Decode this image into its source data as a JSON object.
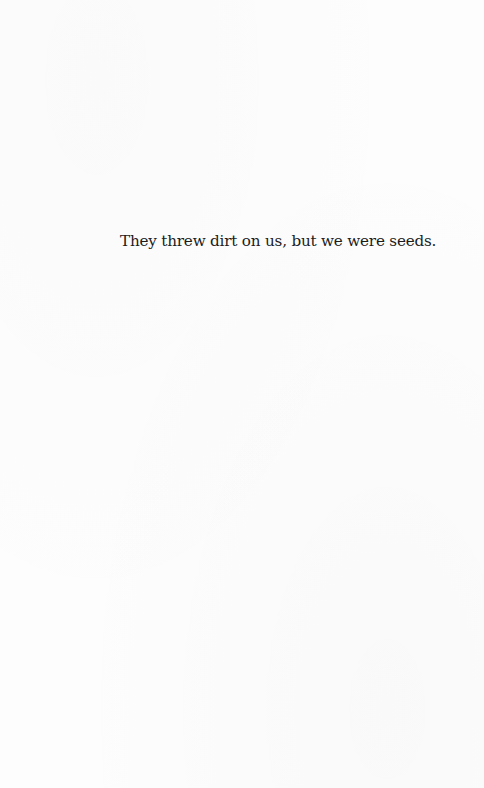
{
  "page": {
    "background_color": "#fdfdfd",
    "text_color": "#1c1c1c"
  },
  "epigraph": {
    "text": "They threw dirt on us, but we were seeds."
  }
}
